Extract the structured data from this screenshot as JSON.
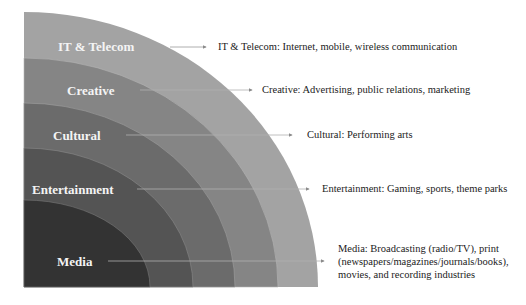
{
  "diagram": {
    "type": "concentric-quarter-circle",
    "origin": {
      "x": 24,
      "y": 287
    },
    "layers": [
      {
        "name": "IT & Telecom",
        "label": "IT & Telecom",
        "description": "IT & Telecom: Internet, mobile, wireless communication",
        "color": "#a3a3a3",
        "rx": 294,
        "ry": 275
      },
      {
        "name": "Creative",
        "label": "Creative",
        "description": "Creative: Advertising, public relations, marketing",
        "color": "#858585",
        "rx": 254,
        "ry": 229
      },
      {
        "name": "Cultural",
        "label": "Cultural",
        "description": "Cultural: Performing arts",
        "color": "#6b6b6b",
        "rx": 211,
        "ry": 184
      },
      {
        "name": "Entertainment",
        "label": "Entertainment",
        "description": "Entertainment: Gaming, sports, theme parks",
        "color": "#545454",
        "rx": 169,
        "ry": 139
      },
      {
        "name": "Media",
        "label": "Media",
        "description_lines": [
          "Media: Broadcasting (radio/TV), print",
          "(newspapers/magazines/journals/books),",
          "movies, and recording industries"
        ],
        "color": "#333333",
        "rx": 126,
        "ry": 87
      }
    ]
  }
}
